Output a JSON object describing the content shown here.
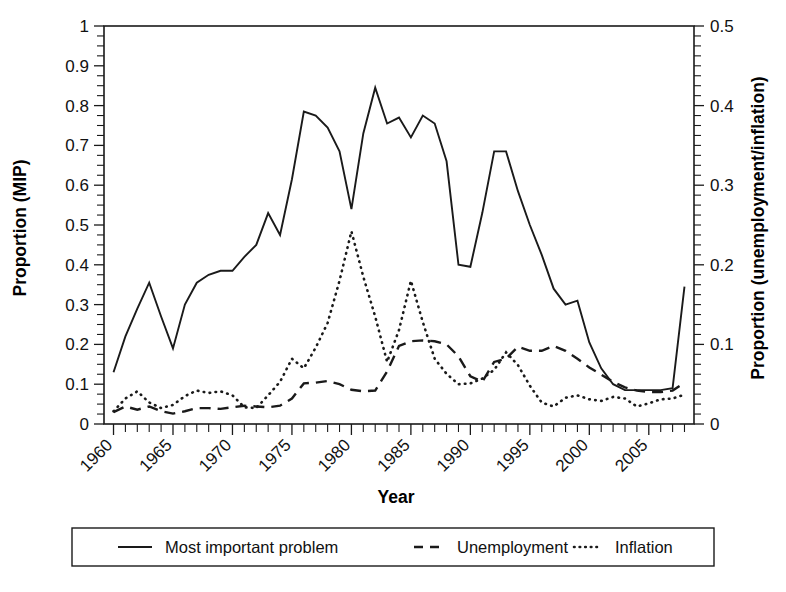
{
  "chart_data": {
    "type": "line",
    "title": "",
    "xlabel": "Year",
    "ylabel": "Proportion (MIP)",
    "ylabel_right": "Proportion (unemployment/inflation)",
    "xlim": [
      1959.2,
      2008.8
    ],
    "ylim": [
      0,
      1
    ],
    "ylim_right": [
      0,
      0.5
    ],
    "grid": false,
    "legend_position": "below-plot",
    "x_tick_labels": [
      "1960",
      "1965",
      "1970",
      "1975",
      "1980",
      "1985",
      "1990",
      "1995",
      "2000",
      "2005"
    ],
    "x_tick_values": [
      1960,
      1965,
      1970,
      1975,
      1980,
      1985,
      1990,
      1995,
      2000,
      2005
    ],
    "x_minor_tick_step": 1,
    "y_tick_labels": [
      "0",
      "0.1",
      "0.2",
      "0.3",
      "0.4",
      "0.5",
      "0.6",
      "0.7",
      "0.8",
      "0.9",
      "1"
    ],
    "y_tick_values": [
      0,
      0.1,
      0.2,
      0.3,
      0.4,
      0.5,
      0.6,
      0.7,
      0.8,
      0.9,
      1
    ],
    "y_right_tick_labels": [
      "0",
      "0.1",
      "0.2",
      "0.3",
      "0.4",
      "0.5"
    ],
    "y_right_tick_values": [
      0,
      0.1,
      0.2,
      0.3,
      0.4,
      0.5
    ],
    "x": [
      1960,
      1961,
      1962,
      1963,
      1964,
      1965,
      1966,
      1967,
      1968,
      1969,
      1970,
      1971,
      1972,
      1973,
      1974,
      1975,
      1976,
      1977,
      1978,
      1979,
      1980,
      1981,
      1982,
      1983,
      1984,
      1985,
      1986,
      1987,
      1988,
      1989,
      1990,
      1991,
      1992,
      1993,
      1994,
      1995,
      1996,
      1997,
      1998,
      1999,
      2000,
      2001,
      2002,
      2003,
      2004,
      2005,
      2006,
      2007,
      2008
    ],
    "series": [
      {
        "name": "Most important problem",
        "axis": "left",
        "style": "solid",
        "values": [
          0.13,
          0.22,
          0.29,
          0.355,
          0.27,
          0.19,
          0.3,
          0.355,
          0.375,
          0.385,
          0.385,
          0.42,
          0.45,
          0.53,
          0.475,
          0.615,
          0.785,
          0.775,
          0.745,
          0.685,
          0.54,
          0.73,
          0.845,
          0.755,
          0.77,
          0.72,
          0.775,
          0.755,
          0.66,
          0.4,
          0.395,
          0.53,
          0.685,
          0.685,
          0.585,
          0.5,
          0.425,
          0.34,
          0.3,
          0.31,
          0.205,
          0.14,
          0.1,
          0.085,
          0.085,
          0.085,
          0.085,
          0.09,
          0.345
        ]
      },
      {
        "name": "Unemployment",
        "axis": "right",
        "style": "dashed",
        "values": [
          0.015,
          0.022,
          0.018,
          0.022,
          0.016,
          0.013,
          0.016,
          0.02,
          0.02,
          0.019,
          0.021,
          0.023,
          0.022,
          0.021,
          0.023,
          0.032,
          0.051,
          0.052,
          0.054,
          0.05,
          0.043,
          0.041,
          0.042,
          0.066,
          0.098,
          0.104,
          0.105,
          0.104,
          0.1,
          0.085,
          0.06,
          0.053,
          0.078,
          0.082,
          0.097,
          0.092,
          0.092,
          0.098,
          0.092,
          0.082,
          0.071,
          0.062,
          0.053,
          0.046,
          0.042,
          0.04,
          0.04,
          0.042,
          0.052
        ]
      },
      {
        "name": "Inflation",
        "axis": "right",
        "style": "dotted",
        "values": [
          0.016,
          0.032,
          0.041,
          0.027,
          0.02,
          0.024,
          0.035,
          0.042,
          0.039,
          0.041,
          0.036,
          0.021,
          0.02,
          0.036,
          0.053,
          0.082,
          0.07,
          0.096,
          0.127,
          0.18,
          0.242,
          0.185,
          0.135,
          0.078,
          0.118,
          0.18,
          0.128,
          0.082,
          0.063,
          0.05,
          0.051,
          0.057,
          0.068,
          0.09,
          0.074,
          0.048,
          0.027,
          0.022,
          0.033,
          0.036,
          0.031,
          0.029,
          0.034,
          0.032,
          0.022,
          0.026,
          0.031,
          0.032,
          0.037
        ]
      }
    ],
    "legend": [
      {
        "label": "Most important problem",
        "style": "solid"
      },
      {
        "label": "Unemployment",
        "style": "dashed"
      },
      {
        "label": "Inflation",
        "style": "dotted"
      }
    ]
  }
}
